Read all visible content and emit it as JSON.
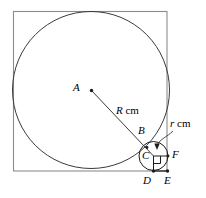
{
  "figure": {
    "colors": {
      "stroke": "#3a3a3a",
      "square_stroke": "#808080",
      "text": "#000000",
      "background": "#ffffff"
    },
    "square": {
      "name": "outer-square",
      "x": 13.5,
      "y": 11.5,
      "width": 153.5,
      "height": 159.5
    },
    "large_circle": {
      "name": "large-circle",
      "cx": 91,
      "cy": 90,
      "r": 78.5
    },
    "small_circle": {
      "name": "small-circle",
      "cx": 153.5,
      "cy": 156,
      "r": 14.5
    },
    "radius_line": {
      "name": "radius-line-A-to-C",
      "x1": 91.5,
      "y1": 90.5,
      "x2": 153.5,
      "y2": 156
    },
    "small_radius_line": {
      "name": "small-radius-line-C-to-F",
      "x1": 153.5,
      "y1": 156,
      "x2": 168,
      "y2": 156
    },
    "drop_line": {
      "name": "perpendicular-C-to-D",
      "x1": 153.5,
      "y1": 156,
      "x2": 153.5,
      "y2": 171
    },
    "base_segment": {
      "name": "segment-D-to-E",
      "x1": 153.5,
      "y1": 171,
      "x2": 167.5,
      "y2": 171
    },
    "right_angle_marker": {
      "name": "right-angle-marker",
      "x": 153.5,
      "y": 156,
      "size": 7
    },
    "leader": {
      "name": "r-cm-leader-line",
      "path": "M 172 132 C 166 138, 160 140, 157.5 144",
      "arrow_tip_x": 157,
      "arrow_tip_y": 148
    },
    "dots": [
      {
        "name": "center-dot-A",
        "cx": 91.5,
        "cy": 90.5,
        "r": 1.6
      },
      {
        "name": "point-dot-B",
        "cx": 147,
        "cy": 147,
        "r": 1.4
      },
      {
        "name": "point-dot-D",
        "cx": 153.5,
        "cy": 171,
        "r": 1.6
      },
      {
        "name": "point-dot-E",
        "cx": 167.5,
        "cy": 171,
        "r": 1.6
      },
      {
        "name": "point-dot-F",
        "cx": 168,
        "cy": 156,
        "r": 1.4
      }
    ],
    "labels": {
      "A": {
        "text": "A",
        "x": 73,
        "y": 82
      },
      "B": {
        "text": "B",
        "x": 138,
        "y": 125
      },
      "C": {
        "text": "C",
        "x": 142,
        "y": 150
      },
      "D": {
        "text": "D",
        "x": 143,
        "y": 175
      },
      "E": {
        "text": "E",
        "x": 164,
        "y": 175
      },
      "F": {
        "text": "F",
        "x": 172,
        "y": 149
      },
      "R_cm": {
        "italic": "R",
        "roman": " cm",
        "x": 116,
        "y": 105
      },
      "r_cm": {
        "italic": "r",
        "roman": " cm",
        "x": 170,
        "y": 118
      }
    }
  }
}
